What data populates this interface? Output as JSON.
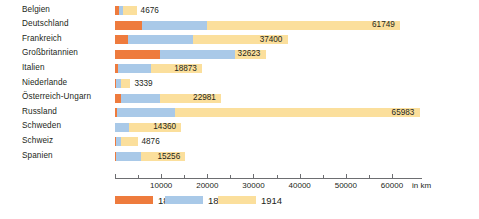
{
  "chart_data": {
    "type": "bar",
    "orientation": "horizontal",
    "stacked": true,
    "title": "",
    "xlabel": "in km",
    "ylabel": "",
    "xlim": [
      0,
      66500
    ],
    "grid": false,
    "legend_position": "bottom",
    "categories": [
      "Belgien",
      "Deutschland",
      "Frankreich",
      "Großbritannien",
      "Italien",
      "Niederlande",
      "Österreich-Ungarn",
      "Russland",
      "Schweden",
      "Schweiz",
      "Spanien"
    ],
    "series": [
      {
        "name": "1850",
        "color": "#ee7b3d",
        "values": [
          854,
          5856,
          2915,
          9797,
          620,
          176,
          1357,
          501,
          0,
          25,
          28
        ]
      },
      {
        "name": "1874",
        "color": "#a9c9e8",
        "values": [
          1800,
          20000,
          17000,
          26000,
          7700,
          1400,
          9700,
          13000,
          3000,
          1400,
          5600
        ]
      },
      {
        "name": "1914",
        "color": "#fbdf9c",
        "values": [
          4676,
          61749,
          37400,
          32623,
          18873,
          3339,
          22981,
          65983,
          14360,
          4876,
          15256
        ]
      }
    ],
    "bar_end_labels": [
      "4676",
      "61749",
      "37400",
      "32623",
      "18873",
      "3339",
      "22981",
      "65983",
      "14360",
      "4876",
      "15256"
    ],
    "xticks_major": [
      0,
      10000,
      20000,
      30000,
      40000,
      50000,
      60000
    ],
    "xticklabels_major": [
      "",
      "10000",
      "20000",
      "30000",
      "40000",
      "50000",
      "60000"
    ],
    "xticks_minor": [
      5000,
      15000,
      25000,
      35000,
      45000,
      55000
    ],
    "axis_unit_label": "in km"
  },
  "legend": {
    "items": [
      {
        "label": "1850",
        "color": "#ee7b3d"
      },
      {
        "label": "1874",
        "color": "#a9c9e8"
      },
      {
        "label": "1914",
        "color": "#fbdf9c"
      }
    ]
  },
  "colors": {
    "series_1850": "#ee7b3d",
    "series_1874": "#a9c9e8",
    "series_1914": "#fbdf9c",
    "axis": "#6d6e71",
    "text": "#231f20",
    "background": "#ffffff"
  }
}
